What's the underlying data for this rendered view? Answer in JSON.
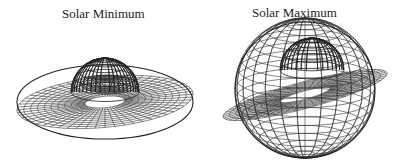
{
  "panels": [
    {
      "title": "Solar Minimum",
      "description": "3D wireframe surface, flattened warped sheet with central depression"
    },
    {
      "title": "Solar Maximum",
      "description": "3D wireframe surface, highly tilted folded sheet enclosing a sphere"
    }
  ],
  "colors": {
    "line": "#333333",
    "background": "#ffffff"
  }
}
